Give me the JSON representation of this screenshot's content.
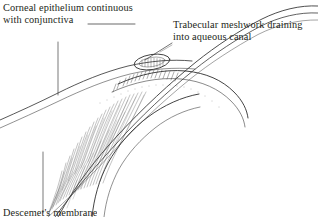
{
  "figure": {
    "width": 318,
    "height": 217,
    "background_color": "#ffffff",
    "ink_color": "#231f20",
    "line_color": "#3a3a3a"
  },
  "labels": {
    "corneal_epithelium": {
      "text": "Corneal epithelium continuous\n with conjunctiva",
      "line1": "Corneal epithelium continuous",
      "line2": "with conjunctiva",
      "leader": "horizontal-then-vertical"
    },
    "trabecular_meshwork": {
      "text": "Trabecular meshwork draining\ninto aqueous canal",
      "line1": "Trabecular meshwork draining",
      "line2": "into aqueous canal",
      "leader": "diagonal-down-left"
    },
    "bottom_cutoff": {
      "text": "Descemet's membrane",
      "note": "clipped at bottom edge of image"
    }
  },
  "structures": [
    {
      "name": "corneal-epithelium-outer-line",
      "kind": "curve"
    },
    {
      "name": "corneal-stroma-inner-line",
      "kind": "curve"
    },
    {
      "name": "sclera-limbus-band",
      "kind": "curve"
    },
    {
      "name": "aqueous-canal",
      "kind": "ellipse"
    },
    {
      "name": "trabecular-meshwork-hatching",
      "kind": "hatching"
    },
    {
      "name": "ciliary-body-fibers",
      "kind": "fiber-fan"
    },
    {
      "name": "iris-root",
      "kind": "curve"
    },
    {
      "name": "anterior-chamber-angle",
      "kind": "region"
    }
  ]
}
